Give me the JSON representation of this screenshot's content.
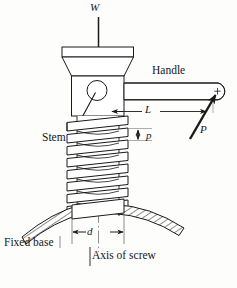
{
  "figure": {
    "background_color": "#fdfdfb",
    "line_color": "#1a1a1a",
    "hatch_color": "#1a1a1a",
    "fill_color": "#ffffff"
  },
  "labels": {
    "load": "W",
    "handle": "Handle",
    "lever_arm": "L",
    "force": "P",
    "stem": "Stem",
    "pitch": "p",
    "diameter": "d",
    "fixed_base": "Fixed base",
    "axis_of_screw": "Axis of screw"
  },
  "annotations": [
    {
      "name": "load-arrow",
      "symbol": "W",
      "kind": "force-arrow",
      "direction": "down"
    },
    {
      "name": "applied-force",
      "symbol": "P",
      "kind": "force-arrow",
      "direction": "up-right"
    },
    {
      "name": "lever-arm-dim",
      "symbol": "L",
      "kind": "dimension-line",
      "direction": "horizontal"
    },
    {
      "name": "pitch-dim",
      "symbol": "p",
      "kind": "dimension-line",
      "direction": "vertical"
    },
    {
      "name": "diameter-dim",
      "symbol": "d",
      "kind": "dimension-line",
      "direction": "horizontal"
    },
    {
      "name": "centerline",
      "symbol": "Axis of screw",
      "kind": "center-line",
      "direction": "vertical"
    }
  ],
  "parts": [
    {
      "name": "cap-top-plate",
      "label": ""
    },
    {
      "name": "cap-taper",
      "label": ""
    },
    {
      "name": "cap-body",
      "label": ""
    },
    {
      "name": "handle-hole",
      "label": ""
    },
    {
      "name": "handle-rod",
      "label": "Handle"
    },
    {
      "name": "screw-stem",
      "label": "Stem"
    },
    {
      "name": "fixed-base",
      "label": "Fixed base"
    }
  ],
  "thread": {
    "turn_count": 8,
    "pitch_symbol": "p"
  }
}
